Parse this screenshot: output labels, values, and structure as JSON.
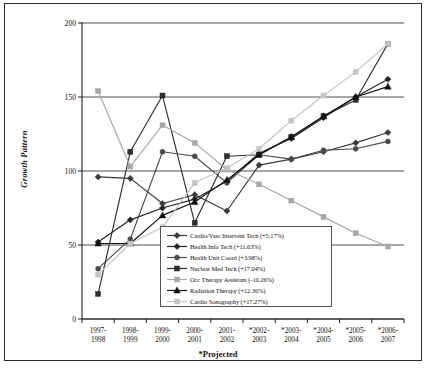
{
  "axes": {
    "ylabel": "Growth Pattern",
    "xnote": "*Projected",
    "yticks": [
      "0",
      "50",
      "100",
      "150",
      "200"
    ],
    "ylim": [
      0,
      200
    ],
    "xticks": [
      {
        "l1": "1997-",
        "l2": "1998"
      },
      {
        "l1": "1998-",
        "l2": "1999"
      },
      {
        "l1": "1999-",
        "l2": "2000"
      },
      {
        "l1": "2000-",
        "l2": "2001"
      },
      {
        "l1": "2001-",
        "l2": "2002"
      },
      {
        "l1": "*2002-",
        "l2": "2003"
      },
      {
        "l1": "*2003-",
        "l2": "2004"
      },
      {
        "l1": "*2004-",
        "l2": "2005"
      },
      {
        "l1": "*2005-",
        "l2": "2006"
      },
      {
        "l1": "*2006-",
        "l2": "2007"
      }
    ]
  },
  "legend": {
    "items": [
      {
        "label": "Cardio/Vasc Intervent Tech (+5.17%)",
        "marker": "diamond",
        "color": "#3a3a3a"
      },
      {
        "label": "Health Info Tech (+11.63%)",
        "marker": "diamond",
        "color": "#242424"
      },
      {
        "label": "Health Unit Coord (+3.98%)",
        "marker": "circle",
        "color": "#4a4a4a"
      },
      {
        "label": "Nuclear Med Tech (+17.04%)",
        "marker": "square",
        "color": "#2e2e2e"
      },
      {
        "label": "Occ Therapy Assistant (-10.26%)",
        "marker": "square",
        "color": "#a8a8a8"
      },
      {
        "label": "Radiation Therapy (+12.36%)",
        "marker": "triangle",
        "color": "#111111"
      },
      {
        "label": "Cardio Sonography (+17.27%)",
        "marker": "square",
        "color": "#c4c4c4"
      }
    ]
  },
  "chart_data": {
    "type": "line",
    "title": "",
    "xlabel": "*Projected",
    "ylabel": "Growth Pattern",
    "ylim": [
      0,
      200
    ],
    "grid": true,
    "legend_position": "inside-bottom-center",
    "categories": [
      "1997-1998",
      "1998-1999",
      "1999-2000",
      "2000-2001",
      "2001-2002",
      "*2002-2003",
      "*2003-2004",
      "*2004-2005",
      "*2005-2006",
      "*2006-2007"
    ],
    "series": [
      {
        "name": "Cardio/Vasc Intervent Tech",
        "growth": "+5.17%",
        "marker": "diamond",
        "color": "#3a3a3a",
        "values": [
          96,
          95,
          78,
          84,
          73,
          104,
          108,
          113,
          119,
          126
        ]
      },
      {
        "name": "Health Info Tech",
        "growth": "+11.63%",
        "marker": "diamond",
        "color": "#242424",
        "values": [
          52,
          67,
          75,
          81,
          93,
          112,
          122,
          136,
          150,
          162
        ]
      },
      {
        "name": "Health Unit Coord",
        "growth": "+3.98%",
        "marker": "circle",
        "color": "#4a4a4a",
        "values": [
          34,
          54,
          113,
          110,
          92,
          111,
          108,
          114,
          115,
          120
        ]
      },
      {
        "name": "Nuclear Med Tech",
        "growth": "+17.04%",
        "marker": "square",
        "color": "#2e2e2e",
        "values": [
          17,
          113,
          151,
          65,
          110,
          111,
          123,
          137,
          148,
          186
        ]
      },
      {
        "name": "Occ Therapy Assistant",
        "growth": "-10.26%",
        "marker": "square",
        "color": "#a8a8a8",
        "values": [
          154,
          103,
          131,
          119,
          101,
          91,
          80,
          69,
          58,
          49
        ]
      },
      {
        "name": "Radiation Therapy",
        "growth": "+12.36%",
        "marker": "triangle",
        "color": "#111111",
        "values": [
          51,
          51,
          70,
          79,
          94,
          111,
          123,
          137,
          150,
          157
        ]
      },
      {
        "name": "Cardio Sonography",
        "growth": "+17.27%",
        "marker": "square",
        "color": "#c4c4c4",
        "values": [
          30,
          51,
          62,
          92,
          102,
          115,
          134,
          151,
          167,
          186
        ]
      }
    ]
  }
}
